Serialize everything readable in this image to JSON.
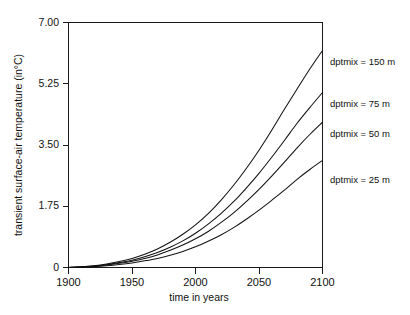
{
  "chart_data": {
    "type": "line",
    "title": "",
    "xlabel": "time in years",
    "ylabel": "transient surface-air temperature (in°C)",
    "xlim": [
      1900,
      2100
    ],
    "ylim": [
      0,
      7.0
    ],
    "xticks": [
      "1900",
      "1950",
      "2000",
      "2050",
      "2100"
    ],
    "xtick_values": [
      1900,
      1950,
      2000,
      2050,
      2100
    ],
    "yticks": [
      "0",
      "1.75",
      "3.50",
      "5.25",
      "7.00"
    ],
    "ytick_values": [
      0,
      1.75,
      3.5,
      5.25,
      7.0
    ],
    "grid": false,
    "legend_position": "inline-right",
    "x": [
      1900,
      1910,
      1920,
      1930,
      1940,
      1950,
      1960,
      1970,
      1980,
      1990,
      2000,
      2010,
      2020,
      2030,
      2040,
      2050,
      2060,
      2070,
      2080,
      2090,
      2100
    ],
    "series": [
      {
        "name": "dptmix = 150 m",
        "label": "dptmix = 150 m",
        "color": "#111111",
        "end_value": 6.2,
        "values": [
          0.0,
          0.02,
          0.05,
          0.1,
          0.17,
          0.26,
          0.38,
          0.53,
          0.72,
          0.95,
          1.22,
          1.54,
          1.92,
          2.35,
          2.83,
          3.35,
          3.92,
          4.52,
          5.1,
          5.67,
          6.2
        ]
      },
      {
        "name": "dptmix = 75 m",
        "label": "dptmix = 75 m",
        "color": "#111111",
        "end_value": 5.0,
        "values": [
          0.0,
          0.02,
          0.04,
          0.08,
          0.14,
          0.21,
          0.31,
          0.43,
          0.58,
          0.76,
          0.98,
          1.24,
          1.54,
          1.88,
          2.27,
          2.69,
          3.15,
          3.63,
          4.12,
          4.57,
          5.0
        ]
      },
      {
        "name": "dptmix = 50 m",
        "label": "dptmix = 50 m",
        "color": "#111111",
        "end_value": 4.15,
        "values": [
          0.0,
          0.015,
          0.035,
          0.07,
          0.12,
          0.18,
          0.26,
          0.36,
          0.49,
          0.64,
          0.82,
          1.03,
          1.28,
          1.56,
          1.88,
          2.23,
          2.61,
          3.01,
          3.42,
          3.8,
          4.15
        ]
      },
      {
        "name": "dptmix = 25 m",
        "label": "dptmix = 25 m",
        "color": "#111111",
        "end_value": 3.06,
        "values": [
          0.0,
          0.01,
          0.025,
          0.05,
          0.085,
          0.13,
          0.19,
          0.26,
          0.35,
          0.46,
          0.59,
          0.75,
          0.93,
          1.14,
          1.38,
          1.64,
          1.92,
          2.21,
          2.52,
          2.8,
          3.06
        ]
      }
    ]
  },
  "figure": {
    "background_color": "#ffffff",
    "axis_color": "#1a1a1a"
  }
}
